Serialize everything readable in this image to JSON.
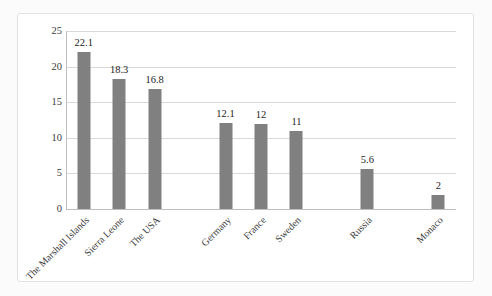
{
  "chart_data": {
    "type": "bar",
    "title": "",
    "subtitle": "",
    "xlabel": "",
    "ylabel": "",
    "categories": [
      "The Marshall Islands",
      "Sierra Leone",
      "The USA",
      "",
      "Germany",
      "France",
      "Sweden",
      "",
      "Russia",
      "",
      "Monaco"
    ],
    "values": [
      22.1,
      18.3,
      16.8,
      null,
      12.1,
      12,
      11,
      null,
      5.6,
      null,
      2
    ],
    "data_labels": [
      "22.1",
      "18.3",
      "16.8",
      "",
      "12.1",
      "12",
      "11",
      "",
      "5.6",
      "",
      "2"
    ],
    "ylim": [
      0,
      25
    ],
    "ytick_labels": [
      "0",
      "5",
      "10",
      "15",
      "20",
      "25"
    ],
    "ytick_values": [
      0,
      5,
      10,
      15,
      20,
      25
    ],
    "grid": true,
    "grid_orientation": "horizontal",
    "legend": false,
    "legend_position": "none",
    "series": [
      {
        "name": "",
        "values": [
          22.1,
          18.3,
          16.8,
          null,
          12.1,
          12,
          11,
          null,
          5.6,
          null,
          2
        ],
        "color": "#808080"
      }
    ],
    "bar_color": "#808080",
    "plot_background": "#ffffff",
    "gridline_color": "#d9d9d9",
    "axis_color": "#bfbfbf",
    "label_rotation_degrees": -45
  },
  "frame": {
    "background": "#ffffff",
    "border_color": "#e2e2e2"
  },
  "page": {
    "background": "#fbfbfb"
  }
}
